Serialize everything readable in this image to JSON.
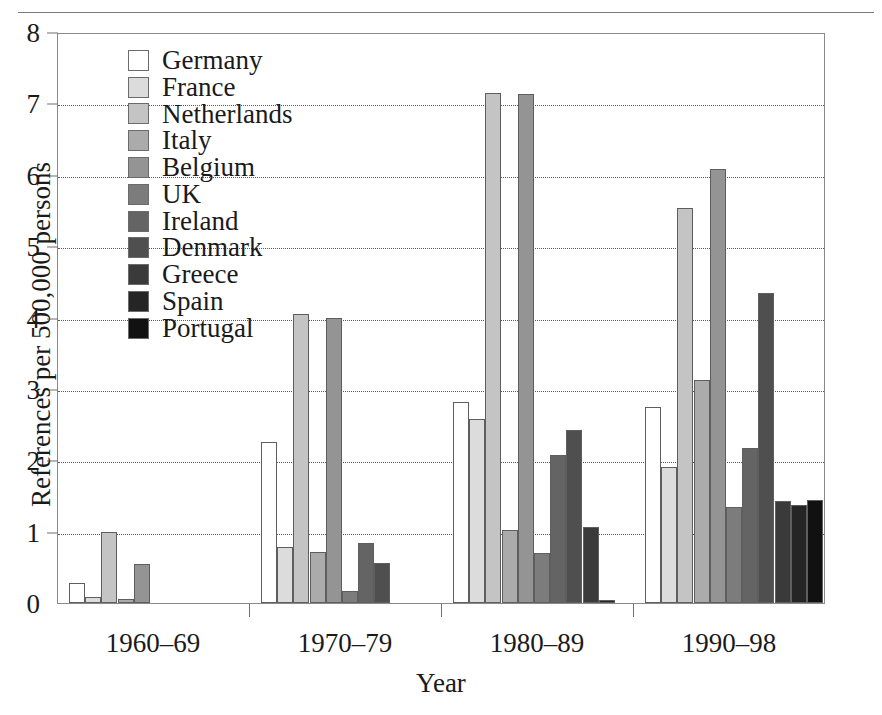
{
  "chart_data": {
    "type": "bar",
    "title": "",
    "xlabel": "Year",
    "ylabel": "References per 500,000 persons",
    "categories": [
      "1960–69",
      "1970–79",
      "1980–89",
      "1990–98"
    ],
    "ylim": [
      0,
      8
    ],
    "yticks": [
      0,
      1,
      2,
      3,
      4,
      5,
      6,
      7,
      8
    ],
    "ytick_labels": [
      "0",
      "1",
      "2",
      "3",
      "4",
      "5",
      "6",
      "7",
      "8"
    ],
    "grid": true,
    "grid_axis": "y",
    "legend_position": "upper left",
    "series": [
      {
        "name": "Germany",
        "color": "#ffffff",
        "values": [
          0.28,
          2.26,
          2.82,
          2.75
        ]
      },
      {
        "name": "France",
        "color": "#dcdcdc",
        "values": [
          0.08,
          0.78,
          2.58,
          1.91
        ]
      },
      {
        "name": "Netherlands",
        "color": "#c4c4c4",
        "values": [
          1.0,
          4.05,
          7.14,
          5.53
        ]
      },
      {
        "name": "Italy",
        "color": "#ababab",
        "values": [
          0.05,
          0.72,
          1.02,
          3.13
        ]
      },
      {
        "name": "Belgium",
        "color": "#949494",
        "values": [
          0.55,
          3.99,
          7.13,
          6.08
        ]
      },
      {
        "name": "UK",
        "color": "#7c7c7c",
        "values": [
          0.0,
          0.17,
          0.7,
          1.34
        ]
      },
      {
        "name": "Ireland",
        "color": "#646464",
        "values": [
          0.0,
          0.84,
          2.07,
          2.17
        ]
      },
      {
        "name": "Denmark",
        "color": "#4f4f4f",
        "values": [
          0.0,
          0.56,
          2.42,
          4.35
        ]
      },
      {
        "name": "Greece",
        "color": "#3a3a3a",
        "values": [
          0.0,
          0.0,
          1.07,
          1.43
        ]
      },
      {
        "name": "Spain",
        "color": "#252525",
        "values": [
          0.0,
          0.0,
          0.04,
          1.38
        ]
      },
      {
        "name": "Portugal",
        "color": "#111111",
        "values": [
          0.0,
          0.0,
          0.0,
          1.44
        ]
      }
    ]
  },
  "legend": {
    "items": [
      {
        "label": "Germany"
      },
      {
        "label": "France"
      },
      {
        "label": "Netherlands"
      },
      {
        "label": "Italy"
      },
      {
        "label": "Belgium"
      },
      {
        "label": "UK"
      },
      {
        "label": "Ireland"
      },
      {
        "label": "Denmark"
      },
      {
        "label": "Greece"
      },
      {
        "label": "Spain"
      },
      {
        "label": "Portugal"
      }
    ]
  }
}
